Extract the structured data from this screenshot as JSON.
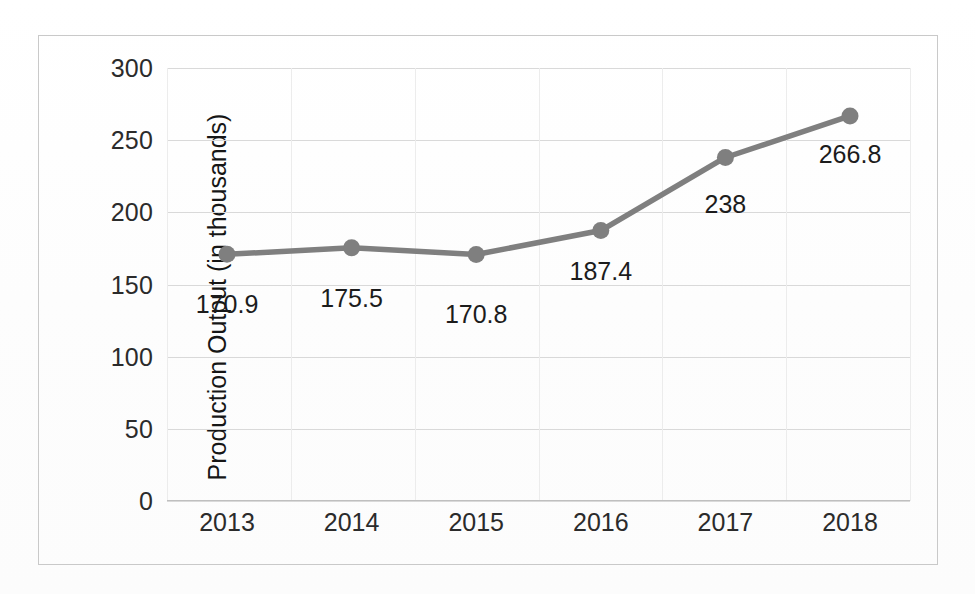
{
  "chart_data": {
    "type": "line",
    "title": "",
    "xlabel": "",
    "ylabel": "Production Output (in thousands)",
    "categories": [
      "2013",
      "2014",
      "2015",
      "2016",
      "2017",
      "2018"
    ],
    "values": [
      170.9,
      175.5,
      170.8,
      187.4,
      238,
      266.8
    ],
    "data_labels": [
      "170.9",
      "175.5",
      "170.8",
      "187.4",
      "238",
      "266.8"
    ],
    "series": [
      {
        "name": "Production Output",
        "values": [
          170.9,
          175.5,
          170.8,
          187.4,
          238,
          266.8
        ]
      }
    ],
    "ylim": [
      0,
      300
    ],
    "yticks": [
      300,
      250,
      200,
      150,
      100,
      50,
      0
    ],
    "ytick_labels": [
      "300",
      "250",
      "200",
      "150",
      "100",
      "50",
      "0"
    ],
    "grid": true,
    "grid_horizontal": true,
    "grid_vertical": true,
    "legend": false,
    "legend_position": "none",
    "marker": "circle",
    "line_color": "#7f7f7f",
    "marker_color": "#7f7f7f",
    "grid_color": "#d9d9d9",
    "text_color": "#1c1c1c",
    "border_color": "#c9c9c9",
    "background": "#ffffff"
  }
}
